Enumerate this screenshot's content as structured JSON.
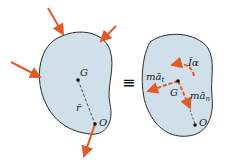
{
  "diagram": {
    "colors": {
      "body_fill": "#cfe0ea",
      "outline": "#2a2a2a",
      "arrow": "#e05a2a"
    },
    "left_body": {
      "labels": {
        "G": "G",
        "r": "r̄",
        "O": "O"
      }
    },
    "equivalence_symbol": "≡",
    "right_body": {
      "labels": {
        "I_alpha": "Īα",
        "ma_t": "mā",
        "ma_t_sub": "t",
        "ma_n": "mā",
        "ma_n_sub": "n",
        "G": "G",
        "O": "O"
      }
    }
  }
}
